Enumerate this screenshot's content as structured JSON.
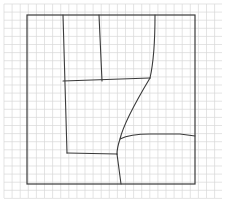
{
  "diagram": {
    "type": "hand-drawn floor plan sketch on grid paper",
    "colors": {
      "background": "#ffffff",
      "grid": "#d9d9d9",
      "ink": "#3a3a3a"
    },
    "grid": {
      "x0": 4,
      "y0": 4,
      "x1": 222,
      "y1": 198,
      "spacing": 8.1
    },
    "outer_boundary": {
      "x": 27,
      "y": 15,
      "width": 168,
      "height": 169
    },
    "strokes": [
      {
        "name": "left-room-wall",
        "d": "M63 15 L67 153"
      },
      {
        "name": "upper-divider-wall",
        "d": "M99 15 L102 81"
      },
      {
        "name": "upper-right-wall",
        "d": "M155 15 C155 45 153 65 150 78"
      },
      {
        "name": "middle-horizontal-wall",
        "d": "M63 81 L150 78"
      },
      {
        "name": "diagonal-curved-wall",
        "d": "M150 78 C138 98 124 122 120 139 C118 145 117 150 117 154"
      },
      {
        "name": "lower-horizontal-wall",
        "d": "M67 153 L117 154"
      },
      {
        "name": "bottom-vertical-wall",
        "d": "M117 154 L121 184"
      },
      {
        "name": "right-curved-wall",
        "d": "M120 139 C128 135 140 134 150 134 L180 134 L195 136"
      }
    ]
  }
}
